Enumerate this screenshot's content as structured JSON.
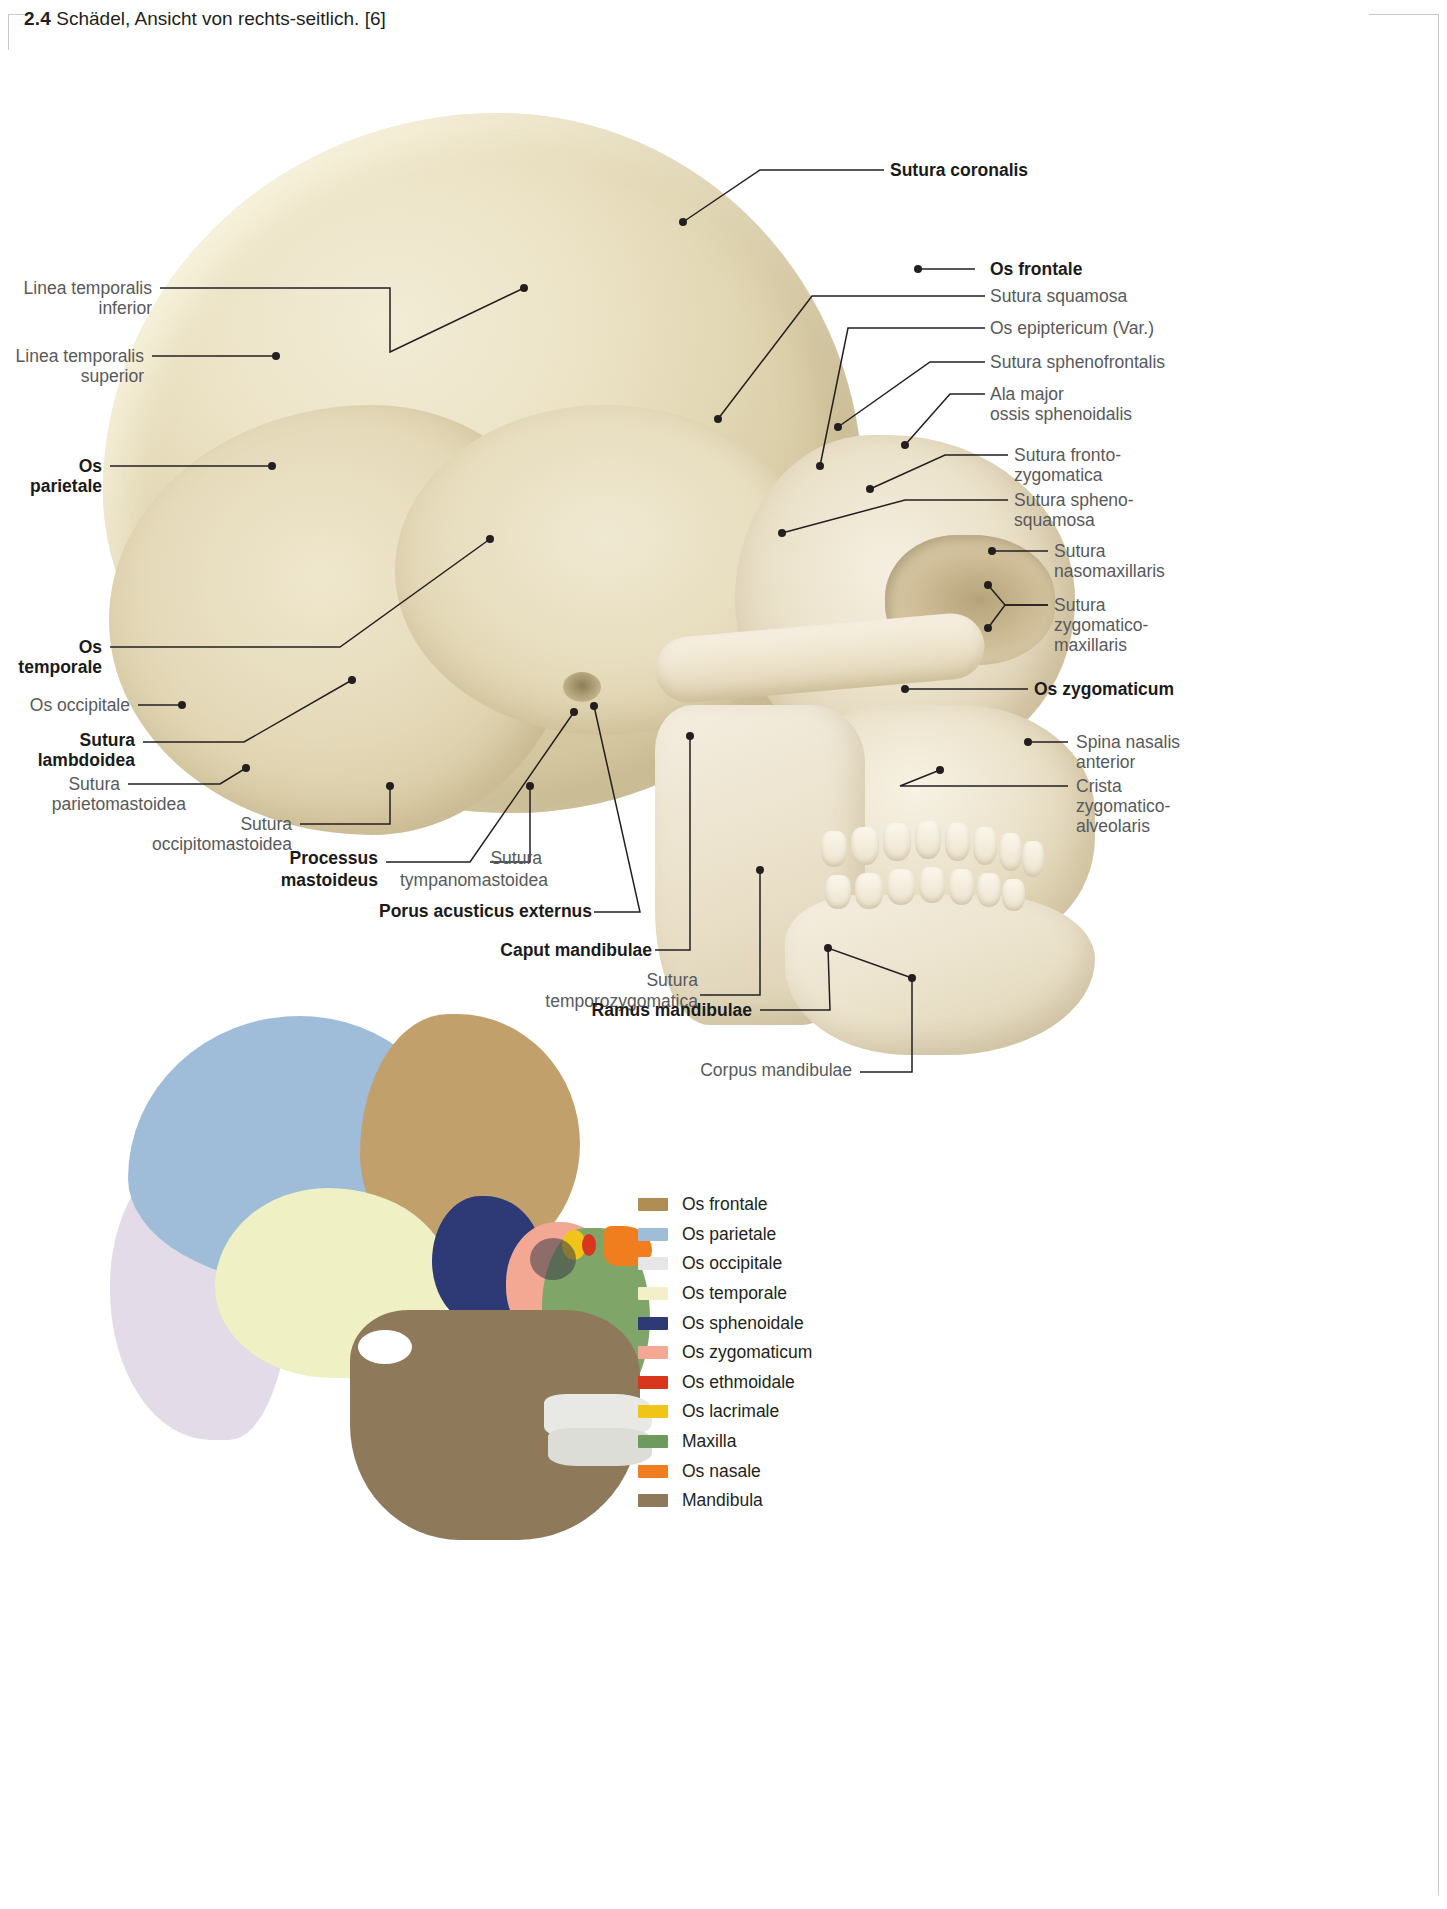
{
  "header": {
    "number": "2.4",
    "title": "Schädel, Ansicht von rechts-seitlich. [6]"
  },
  "figure": {
    "caption_number": "2.4",
    "caption_text": "Schädel, Ansicht von rechts-seitlich.",
    "source_ref": "[6]"
  },
  "labels_right": [
    {
      "id": "sutura-coronalis",
      "text": "Sutura coronalis",
      "bold": true
    },
    {
      "id": "os-frontale",
      "text": "Os frontale",
      "bold": true
    },
    {
      "id": "sutura-squamosa",
      "text": "Sutura squamosa",
      "bold": false
    },
    {
      "id": "os-epiptericum",
      "text": "Os epiptericum (Var.)",
      "bold": false
    },
    {
      "id": "sutura-sphenofrontalis",
      "text": "Sutura sphenofrontalis",
      "bold": false
    },
    {
      "id": "ala-major",
      "text": "Ala major",
      "bold": false
    },
    {
      "id": "ala-major-2",
      "text": "ossis sphenoidalis",
      "bold": false
    },
    {
      "id": "sutura-frontozygomatica",
      "text": "Sutura fronto-",
      "bold": false
    },
    {
      "id": "sutura-frontozygomatica-2",
      "text": "zygomatica",
      "bold": false
    },
    {
      "id": "sutura-sphenosquamosa",
      "text": "Sutura spheno-",
      "bold": false
    },
    {
      "id": "sutura-sphenosquamosa-2",
      "text": "squamosa",
      "bold": false
    },
    {
      "id": "sutura-nasomaxillaris",
      "text": "Sutura",
      "bold": false
    },
    {
      "id": "sutura-nasomaxillaris-2",
      "text": "nasomaxillaris",
      "bold": false
    },
    {
      "id": "sutura-zygomaticomax",
      "text": "Sutura",
      "bold": false
    },
    {
      "id": "sutura-zygomaticomax-2",
      "text": "zygomatico-",
      "bold": false
    },
    {
      "id": "sutura-zygomaticomax-3",
      "text": "maxillaris",
      "bold": false
    },
    {
      "id": "os-zygomaticum",
      "text": "Os zygomaticum",
      "bold": true
    },
    {
      "id": "spina-nasalis",
      "text": "Spina nasalis",
      "bold": false
    },
    {
      "id": "spina-nasalis-2",
      "text": "anterior",
      "bold": false
    },
    {
      "id": "crista-zyg",
      "text": "Crista",
      "bold": false
    },
    {
      "id": "crista-zyg-2",
      "text": "zygomatico-",
      "bold": false
    },
    {
      "id": "crista-zyg-3",
      "text": "alveolaris",
      "bold": false
    }
  ],
  "labels_left": [
    {
      "id": "linea-temporalis-inferior",
      "text": "Linea temporalis",
      "bold": false
    },
    {
      "id": "linea-temporalis-inferior-2",
      "text": "inferior",
      "bold": false
    },
    {
      "id": "linea-temporalis-superior",
      "text": "Linea temporalis",
      "bold": false
    },
    {
      "id": "linea-temporalis-superior-2",
      "text": "superior",
      "bold": false
    },
    {
      "id": "os-parietale",
      "text": "Os",
      "bold": true
    },
    {
      "id": "os-parietale-2",
      "text": "parietale",
      "bold": true
    },
    {
      "id": "os-temporale",
      "text": "Os",
      "bold": true
    },
    {
      "id": "os-temporale-2",
      "text": "temporale",
      "bold": true
    },
    {
      "id": "os-occipitale",
      "text": "Os occipitale",
      "bold": false
    },
    {
      "id": "sutura-lambdoidea",
      "text": "Sutura",
      "bold": true
    },
    {
      "id": "sutura-lambdoidea-2",
      "text": "lambdoidea",
      "bold": true
    },
    {
      "id": "sutura-parietomastoidea",
      "text": "Sutura",
      "bold": false
    },
    {
      "id": "sutura-parietomastoidea-2",
      "text": "parietomastoidea",
      "bold": false
    },
    {
      "id": "sutura-occipitomastoidea",
      "text": "Sutura",
      "bold": false
    },
    {
      "id": "sutura-occipitomastoidea-2",
      "text": "occipitomastoidea",
      "bold": false
    }
  ],
  "labels_bottom": [
    {
      "id": "processus-mastoideus",
      "text": "Processus",
      "bold": true
    },
    {
      "id": "processus-mastoideus-2",
      "text": "mastoideus",
      "bold": true
    },
    {
      "id": "sutura-tympanomastoidea",
      "text": "Sutura",
      "bold": false
    },
    {
      "id": "sutura-tympanomastoidea-2",
      "text": "tympanomastoidea",
      "bold": false
    },
    {
      "id": "porus-acusticus",
      "text": "Porus acusticus externus",
      "bold": true
    },
    {
      "id": "caput-mandibulae",
      "text": "Caput mandibulae",
      "bold": true
    },
    {
      "id": "sutura-temporozygomatica",
      "text": "Sutura",
      "bold": false
    },
    {
      "id": "sutura-temporozygomatica-2",
      "text": "temporozygomatica",
      "bold": false
    },
    {
      "id": "ramus-mandibulae",
      "text": "Ramus mandibulae",
      "bold": true
    },
    {
      "id": "corpus-mandibulae",
      "text": "Corpus mandibulae",
      "bold": false
    }
  ],
  "legend": {
    "items": [
      {
        "label": "Os frontale",
        "color": "#b08d52"
      },
      {
        "label": "Os parietale",
        "color": "#9fbcd8"
      },
      {
        "label": "Os occipitale",
        "color": "#e6e6e6"
      },
      {
        "label": "Os temporale",
        "color": "#f2f0c8"
      },
      {
        "label": "Os sphenoidale",
        "color": "#2d3a75"
      },
      {
        "label": "Os zygomaticum",
        "color": "#f3a894"
      },
      {
        "label": "Os ethmoidale",
        "color": "#d8371d"
      },
      {
        "label": "Os lacrimale",
        "color": "#f0c419"
      },
      {
        "label": "Maxilla",
        "color": "#6f9a5e"
      },
      {
        "label": "Os nasale",
        "color": "#f07d1e"
      },
      {
        "label": "Mandibula",
        "color": "#8e7a5a"
      }
    ]
  },
  "colors": {
    "text_gray": "#58595b",
    "text_dark": "#231f20",
    "leader_line": "#231f20",
    "bone": "#ece3c6",
    "page_bg": "#ffffff"
  }
}
